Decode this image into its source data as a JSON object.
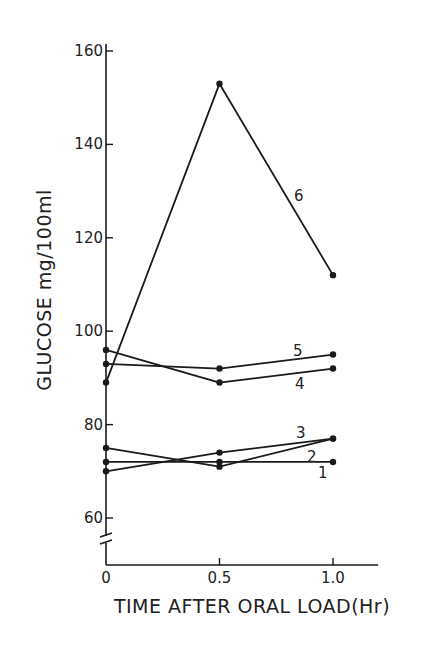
{
  "chart_data": {
    "type": "line",
    "title": "",
    "xlabel": "TIME AFTER ORAL LOAD(Hr)",
    "ylabel": "GLUCOSE mg/100ml",
    "x": [
      0,
      0.5,
      1.0
    ],
    "x_tick_labels": [
      "0",
      "0.5",
      "1.0"
    ],
    "y_ticks": [
      60,
      80,
      100,
      120,
      140,
      160
    ],
    "y_tick_labels": [
      "60",
      "80",
      "100",
      "120",
      "140",
      "160"
    ],
    "ylim": [
      50,
      160
    ],
    "y_axis_break": true,
    "grid": false,
    "legend": "inline labels at line ends",
    "series": [
      {
        "name": "1",
        "values": [
          72,
          72,
          72
        ]
      },
      {
        "name": "2",
        "values": [
          75,
          71,
          77
        ]
      },
      {
        "name": "3",
        "values": [
          70,
          74,
          77
        ]
      },
      {
        "name": "4",
        "values": [
          96,
          89,
          92
        ]
      },
      {
        "name": "5",
        "values": [
          93,
          92,
          95
        ]
      },
      {
        "name": "6",
        "values": [
          89,
          153,
          112
        ]
      }
    ]
  },
  "series_label_positions": {
    "1": [
      318,
      478
    ],
    "2": [
      307,
      462
    ],
    "3": [
      296,
      438
    ],
    "4": [
      295,
      389
    ],
    "5": [
      293,
      356
    ],
    "6": [
      294,
      201
    ]
  },
  "colors": {
    "ink": "#1a1a1a",
    "background": "#ffffff"
  }
}
